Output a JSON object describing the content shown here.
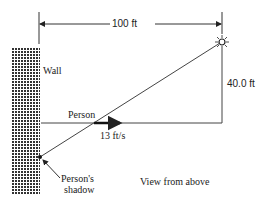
{
  "diagram": {
    "dimension_top": "100 ft",
    "dimension_right": "40.0 ft",
    "wall_label": "Wall",
    "person_label": "Person",
    "speed_label": "13 ft/s",
    "shadow_label_line1": "Person's",
    "shadow_label_line2": "shadow",
    "caption": "View from above",
    "colors": {
      "ink": "#222222",
      "wall": "#444444",
      "background": "#ffffff"
    }
  }
}
